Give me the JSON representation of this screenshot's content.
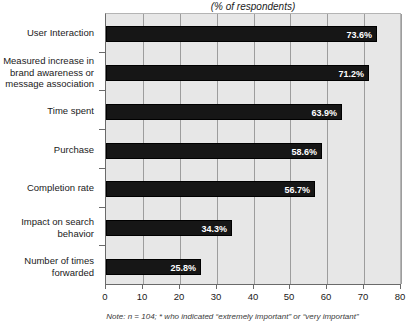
{
  "chart_data": {
    "type": "bar",
    "orientation": "horizontal",
    "title": "(% of respondents)",
    "xlabel": "",
    "ylabel": "",
    "xlim": [
      0,
      80
    ],
    "xticks": [
      0,
      10,
      20,
      30,
      40,
      50,
      60,
      70,
      80
    ],
    "grid": true,
    "legend": null,
    "categories": [
      "User Interaction",
      "Measured increase in brand awareness or message association",
      "Time spent",
      "Purchase",
      "Completion rate",
      "Impact on search behavior",
      "Number of times forwarded"
    ],
    "values": [
      73.6,
      71.2,
      63.9,
      58.6,
      56.7,
      34.3,
      25.8
    ],
    "value_labels": [
      "73.6%",
      "71.2%",
      "63.9%",
      "58.6%",
      "56.7%",
      "34.3%",
      "25.8%"
    ],
    "tick_labels": [
      "0",
      "10",
      "20",
      "30",
      "40",
      "50",
      "60",
      "70",
      "80"
    ],
    "note": "Note: n = 104; * who indicated “extremely important” or “very important”",
    "colors": {
      "bar": "#161616",
      "plot_background": "#e7e7e7",
      "gridline": "#9d9d9d",
      "axis": "#6a6a6a",
      "value_label": "#ffffff",
      "text": "#1a1a1a"
    }
  },
  "category_label_lines": [
    [
      "User Interaction"
    ],
    [
      "Measured increase in",
      "brand awareness or",
      "message association"
    ],
    [
      "Time spent"
    ],
    [
      "Purchase"
    ],
    [
      "Completion rate"
    ],
    [
      "Impact on search",
      "behavior"
    ],
    [
      "Number of times",
      "forwarded"
    ]
  ]
}
